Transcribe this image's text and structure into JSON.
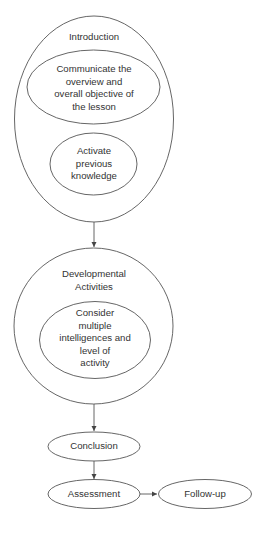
{
  "diagram": {
    "type": "flowchart",
    "colors": {
      "stroke": "#555555",
      "text": "#333333",
      "background": "#ffffff"
    },
    "nodes": {
      "introduction": {
        "title": "Introduction",
        "children": {
          "communicate": {
            "lines": [
              "Communicate the",
              "overview and",
              "overall objective of",
              "the lesson"
            ]
          },
          "activate": {
            "lines": [
              "Activate",
              "previous",
              "knowledge"
            ]
          }
        }
      },
      "developmental": {
        "title_lines": [
          "Developmental",
          "Activities"
        ],
        "children": {
          "consider": {
            "lines": [
              "Consider",
              "multiple",
              "intelligences and",
              "level of",
              "activity"
            ]
          }
        }
      },
      "conclusion": {
        "label": "Conclusion"
      },
      "assessment": {
        "label": "Assessment"
      },
      "followup": {
        "label": "Follow-up"
      }
    },
    "edges": [
      {
        "from": "Introduction",
        "to": "Developmental Activities"
      },
      {
        "from": "Developmental Activities",
        "to": "Conclusion"
      },
      {
        "from": "Conclusion",
        "to": "Assessment"
      },
      {
        "from": "Assessment",
        "to": "Follow-up"
      }
    ]
  }
}
